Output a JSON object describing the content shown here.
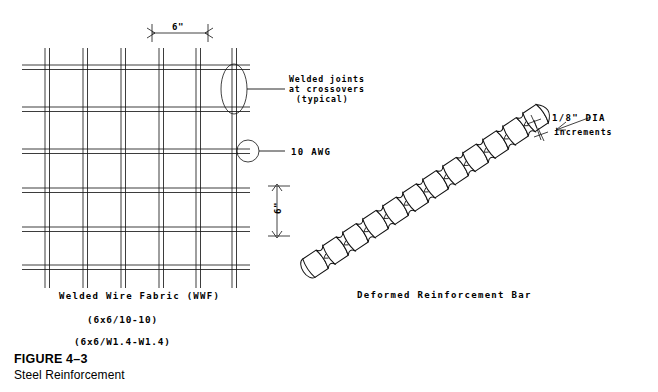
{
  "figure": {
    "number": "FIGURE 4–3",
    "title": "Steel Reinforcement"
  },
  "mesh": {
    "caption": "Welded Wire Fabric (WWF)",
    "spec_imperial": "(6x6/10-10)",
    "spec_metric": "(6x6/W1.4-W1.4)",
    "dimension_horizontal": "6\"",
    "dimension_vertical": "6\"",
    "callouts": [
      {
        "id": "welded-joints",
        "line1": "Welded joints",
        "line2": "at crossovers",
        "line3": "(typical)",
        "marker": "ellipse"
      },
      {
        "id": "wire-gauge",
        "line1": "10 AWG",
        "marker": "circle"
      }
    ],
    "grid": {
      "vertical_wires": 7,
      "horizontal_wires": 6
    }
  },
  "rebar": {
    "caption": "Deformed Reinforcement Bar",
    "callout_line1": "1/8\" DIA",
    "callout_line2": "increments",
    "segments": 12
  },
  "colors": {
    "ink": "#111111",
    "paper": "#ffffff"
  }
}
